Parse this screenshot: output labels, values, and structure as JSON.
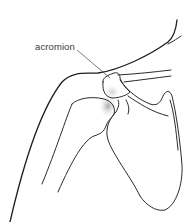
{
  "diagram": {
    "labels": [
      {
        "text": "acromion",
        "x": 35,
        "y": 42
      }
    ],
    "colors": {
      "line": "#2a2a2a",
      "shade": "#9a9a9a",
      "background": "#ffffff"
    }
  }
}
